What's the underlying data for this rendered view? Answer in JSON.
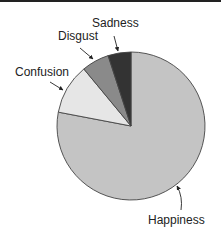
{
  "chart_data": {
    "type": "pie",
    "title": "",
    "start_angle": "12 o'clock, clockwise",
    "slices": [
      {
        "label": "Happiness",
        "value": 78,
        "color": "#c4c4c4"
      },
      {
        "label": "Confusion",
        "value": 11,
        "color": "#e6e6e6"
      },
      {
        "label": "Disgust",
        "value": 6,
        "color": "#8a8a8a"
      },
      {
        "label": "Sadness",
        "value": 5,
        "color": "#333333"
      }
    ],
    "legend": "none (callout labels with arrows)"
  },
  "labels": {
    "happiness": "Happiness",
    "confusion": "Confusion",
    "disgust": "Disgust",
    "sadness": "Sadness"
  }
}
